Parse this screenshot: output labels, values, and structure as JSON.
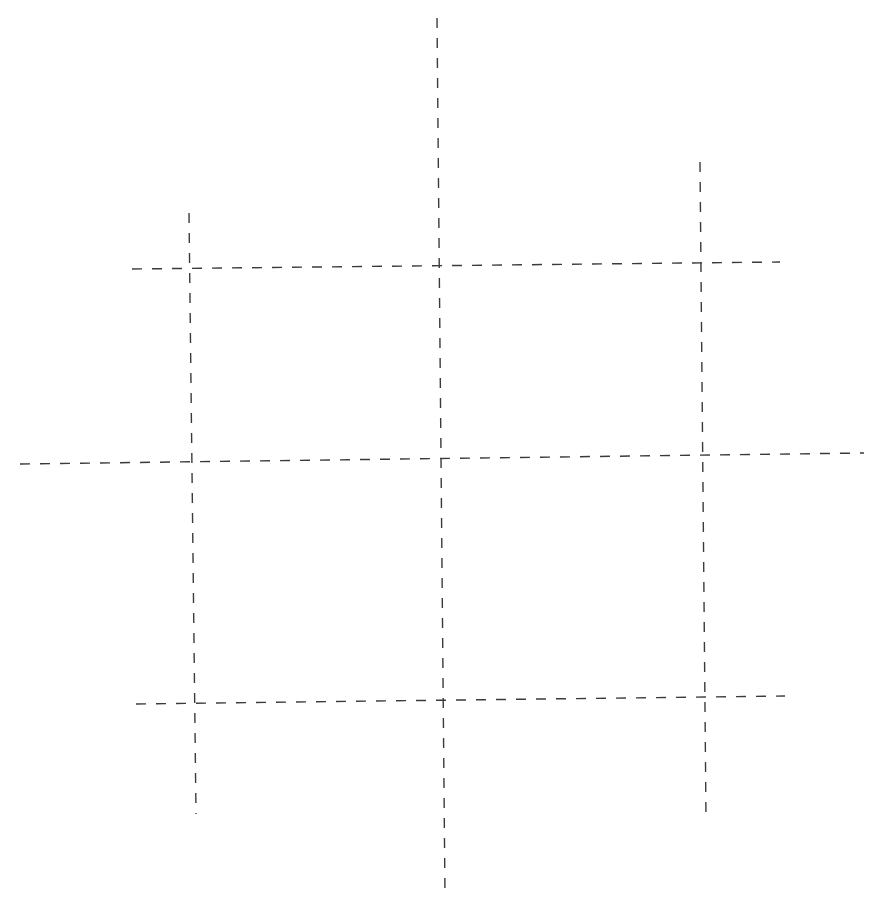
{
  "board": {
    "type": "tic-tac-toe-grid",
    "line_color": "#3a3a3a",
    "line_width": 1.4,
    "dash_pattern": [
      10,
      10
    ],
    "lines": [
      {
        "id": "vertical-left",
        "x1": 189,
        "y1": 213,
        "x2": 196,
        "y2": 814
      },
      {
        "id": "vertical-center",
        "x1": 437,
        "y1": 18,
        "x2": 445,
        "y2": 896
      },
      {
        "id": "vertical-right",
        "x1": 700,
        "y1": 162,
        "x2": 706,
        "y2": 817
      },
      {
        "id": "horizontal-top",
        "x1": 132,
        "y1": 269,
        "x2": 780,
        "y2": 262
      },
      {
        "id": "horizontal-middle",
        "x1": 20,
        "y1": 464,
        "x2": 864,
        "y2": 453
      },
      {
        "id": "horizontal-bottom",
        "x1": 136,
        "y1": 704,
        "x2": 785,
        "y2": 696
      }
    ],
    "cells": [
      {
        "row": 0,
        "col": 0,
        "mark": ""
      },
      {
        "row": 0,
        "col": 1,
        "mark": ""
      },
      {
        "row": 1,
        "col": 0,
        "mark": ""
      },
      {
        "row": 1,
        "col": 1,
        "mark": ""
      },
      {
        "row": 2,
        "col": 0,
        "mark": ""
      },
      {
        "row": 2,
        "col": 1,
        "mark": ""
      }
    ]
  }
}
